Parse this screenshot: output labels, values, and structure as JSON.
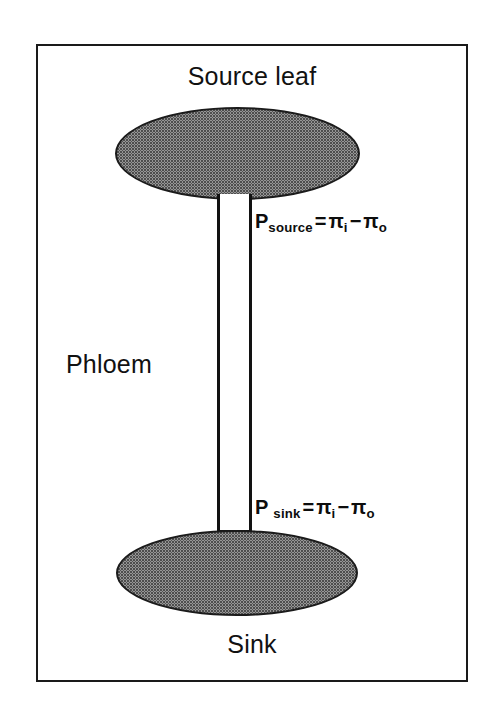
{
  "figure": {
    "type": "biology-diagram",
    "border_color": "#1a1a1a",
    "fill_color": "#d8d8d8",
    "text_color": "#111111"
  },
  "labels": {
    "source_leaf": "Source leaf",
    "phloem": "Phloem",
    "sink": "Sink"
  },
  "equations": {
    "source": {
      "symbol": "P",
      "subscript": "source",
      "operator_equals": "=",
      "first_term": "π",
      "first_subscript": "i",
      "operator_minus": "−",
      "second_term": "π",
      "second_subscript": "o",
      "plain": "P_source = π_i − π_o"
    },
    "sink": {
      "symbol": "P",
      "subscript": "sink",
      "operator_equals": "=",
      "first_term": "π",
      "first_subscript": "i",
      "operator_minus": "−",
      "second_term": "π",
      "second_subscript": "o",
      "plain": "P_sink = π_i − π_o"
    }
  }
}
